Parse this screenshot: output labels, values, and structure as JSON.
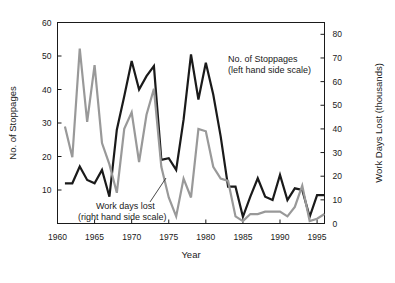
{
  "chart_data": {
    "type": "line",
    "title": "",
    "xlabel": "Year",
    "ylabel": "No. of Stoppages",
    "y2label": "Work Days Lost (thousands)",
    "grid": false,
    "legend_position": "inline-annotations",
    "xlim": [
      1960,
      1996
    ],
    "ylim": [
      0,
      60
    ],
    "y2lim": [
      0,
      85
    ],
    "xticks": [
      1960,
      1965,
      1970,
      1975,
      1980,
      1985,
      1990,
      1995
    ],
    "xtick_labels": [
      "1960",
      "1965",
      "1970",
      "1975",
      "1980",
      "1985",
      "1990",
      "1995"
    ],
    "yticks": [
      10,
      20,
      30,
      40,
      50,
      60
    ],
    "ytick_labels": [
      "10",
      "20",
      "30",
      "40",
      "50",
      "60"
    ],
    "y2ticks": [
      0,
      10,
      20,
      30,
      40,
      50,
      60,
      70,
      80
    ],
    "y2tick_labels": [
      "0",
      "10",
      "20",
      "30",
      "40",
      "50",
      "60",
      "70",
      "80"
    ],
    "x": [
      1961,
      1962,
      1963,
      1964,
      1965,
      1966,
      1967,
      1968,
      1969,
      1970,
      1971,
      1972,
      1973,
      1974,
      1975,
      1976,
      1977,
      1978,
      1979,
      1980,
      1981,
      1982,
      1983,
      1984,
      1985,
      1986,
      1987,
      1988,
      1989,
      1990,
      1991,
      1992,
      1993,
      1994,
      1995,
      1996
    ],
    "series": [
      {
        "name": "No. of Stoppages",
        "scale": "left",
        "color": "#1a1a1a",
        "values": [
          12,
          12,
          17,
          13,
          12,
          16,
          8,
          28,
          38,
          48.5,
          40,
          44,
          47,
          19,
          19.5,
          16,
          31,
          50.5,
          37,
          48,
          38.5,
          26,
          11,
          11,
          2,
          8,
          13.5,
          8,
          7,
          14.5,
          7,
          10.5,
          10,
          2,
          8.5,
          8.5
        ]
      },
      {
        "name": "Work days lost",
        "scale": "right",
        "color": "#999999",
        "values": [
          41,
          28,
          74,
          43,
          67,
          34,
          25,
          13,
          40,
          47,
          26,
          46,
          57,
          24,
          11,
          3,
          19,
          11,
          40,
          39,
          24,
          19,
          18,
          3,
          1,
          4,
          4,
          5,
          5,
          5,
          3,
          7,
          16,
          1,
          2,
          4
        ]
      }
    ],
    "annotations": [
      {
        "name": "stoppages-annotation",
        "line1": "No. of Stoppages",
        "line2": "(left hand side scale)"
      },
      {
        "name": "workdays-annotation",
        "line1": "Work days lost",
        "line2": "(right hand side scale)"
      }
    ]
  }
}
